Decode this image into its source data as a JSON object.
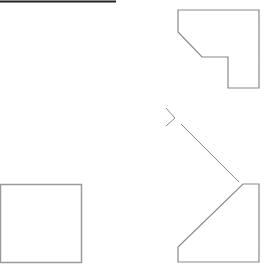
{
  "canvas": {
    "width": 264,
    "height": 268,
    "background": "#ffffff"
  },
  "colors": {
    "top_line": "#222222",
    "shape_stroke": "#8a8a8a",
    "square_stroke": "#9a9a9a"
  },
  "shapes": {
    "top_line": {
      "points": "0,1.5 116,1.5",
      "stroke_width": 2
    },
    "notched_square_top_right": {
      "points": "178,10 259,10 259,88 228,88 228,57 202,57 178,32"
    },
    "chevron_marker": {
      "points": "166,108 175,118 166,126"
    },
    "diagonal_connector": {
      "x1": 181,
      "y1": 124,
      "x2": 239,
      "y2": 182
    },
    "beveled_square_bottom_right": {
      "points": "243,184 259,184 259,262 178,262 178,247"
    },
    "square_bottom_left": {
      "x": 0.5,
      "y": 184.5,
      "width": 81,
      "height": 78
    }
  }
}
